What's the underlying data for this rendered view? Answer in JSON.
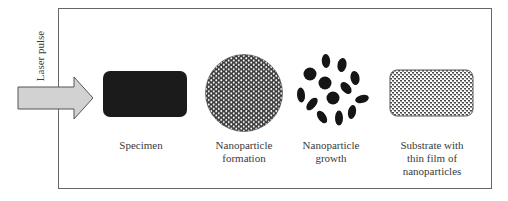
{
  "diagram": {
    "input": {
      "label": "Laser pulse",
      "icon": "arrow-right-icon",
      "fill_color": "#d2d2d2"
    },
    "stages": [
      {
        "id": "specimen",
        "label_lines": [
          "Specimen"
        ],
        "icon": "specimen-block-icon",
        "fill_color": "#1b1b1b"
      },
      {
        "id": "formation",
        "label_lines": [
          "Nanoparticle",
          "formation"
        ],
        "icon": "dense-particle-circle-icon"
      },
      {
        "id": "growth",
        "label_lines": [
          "Nanoparticle",
          "growth"
        ],
        "icon": "particle-cluster-icon"
      },
      {
        "id": "substrate",
        "label_lines": [
          "Substrate with",
          "thin film of",
          "nanoparticles"
        ],
        "icon": "thin-film-substrate-icon"
      }
    ],
    "colors": {
      "frame": "#666666",
      "text": "#3a3a3a",
      "particle": "#151515"
    }
  }
}
